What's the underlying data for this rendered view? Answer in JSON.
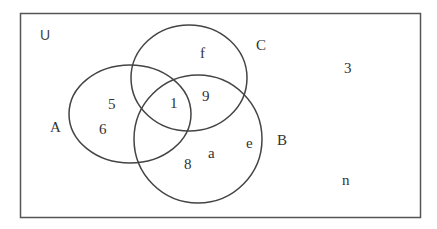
{
  "diagram": {
    "type": "venn",
    "universe_label": "U",
    "colors": {
      "stroke": "#444444",
      "frame": "#555555",
      "text": "#333333",
      "background": "#ffffff"
    },
    "sets": [
      {
        "name": "A",
        "label": "A"
      },
      {
        "name": "B",
        "label": "B"
      },
      {
        "name": "C",
        "label": "C"
      }
    ],
    "regions": {
      "A_only": [
        "5",
        "6"
      ],
      "A_B_C": [
        "1"
      ],
      "B_C_only": [
        "9"
      ],
      "C_only": [
        "f"
      ],
      "B_only": [
        "8",
        "a",
        "e"
      ],
      "outside": [
        "3",
        "n"
      ]
    },
    "elements": {
      "a_only_1": "5",
      "a_only_2": "6",
      "abc": "1",
      "bc": "9",
      "c_only": "f",
      "b_only_1": "8",
      "b_only_2": "a",
      "b_only_3": "e",
      "outside_1": "3",
      "outside_2": "n"
    }
  }
}
